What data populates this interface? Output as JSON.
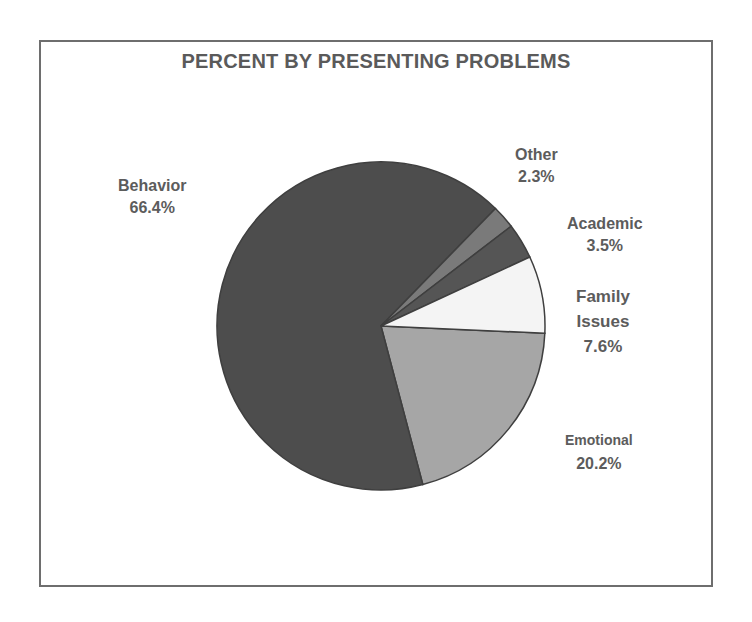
{
  "chart_data": {
    "type": "pie",
    "title": "PERCENT BY PRESENTING PROBLEMS",
    "categories": [
      "Behavior",
      "Emotional",
      "Family Issues",
      "Academic",
      "Other"
    ],
    "values": [
      66.4,
      20.2,
      7.6,
      3.5,
      2.3
    ],
    "unit": "%",
    "colors": {
      "Behavior": "#4d4d4d",
      "Emotional": "#a6a6a6",
      "Family Issues": "#f4f4f4",
      "Academic": "#555555",
      "Other": "#7a7a7a"
    },
    "legend": "none (data labels adjacent to slices)",
    "labels": [
      {
        "name": "Behavior",
        "pct": "66.4%"
      },
      {
        "name": "Other",
        "pct": "2.3%"
      },
      {
        "name": "Academic",
        "pct": "3.5%"
      },
      {
        "name_line1": "Family",
        "name_line2": "Issues",
        "pct": "7.6%"
      },
      {
        "name": "Emotional",
        "pct": "20.2%"
      }
    ]
  }
}
